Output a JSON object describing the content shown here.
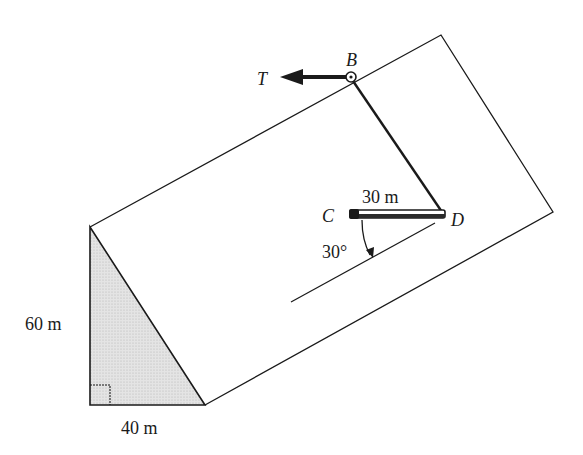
{
  "diagram": {
    "type": "inclined-plane-statics",
    "labels": {
      "point_b": "B",
      "point_c": "C",
      "point_d": "D",
      "force_t": "T",
      "rod_length": "30 m",
      "angle": "30°",
      "height": "60 m",
      "base": "40 m"
    },
    "colors": {
      "line": "#1a1a1a",
      "shade": "#d9d9d9",
      "background": "#ffffff"
    }
  }
}
